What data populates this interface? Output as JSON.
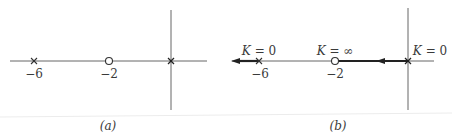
{
  "diagram": {
    "type": "root-locus",
    "colors": {
      "line": "#555555",
      "bold_line": "#222222",
      "text": "#3a3a3a",
      "background": "#ffffff"
    }
  },
  "panels": [
    {
      "id": "a",
      "caption": "(a)",
      "poles": [
        {
          "value": -6,
          "label": "−6",
          "marker": "cross"
        },
        {
          "value": 0,
          "label": "",
          "marker": "cross"
        }
      ],
      "zeros": [
        {
          "value": -2,
          "label": "−2",
          "marker": "circle"
        }
      ]
    },
    {
      "id": "b",
      "caption": "(b)",
      "poles": [
        {
          "value": -6,
          "label": "−6",
          "marker": "cross",
          "gain_label": "K = 0"
        },
        {
          "value": 0,
          "label": "",
          "marker": "cross",
          "gain_label": "K = 0"
        }
      ],
      "zeros": [
        {
          "value": -2,
          "label": "−2",
          "marker": "circle",
          "gain_label": "K = ∞"
        }
      ],
      "locus_segments": [
        {
          "from": 0,
          "to": -2,
          "direction": "left"
        },
        {
          "from": -6,
          "to": "-infinity",
          "direction": "left"
        }
      ]
    }
  ],
  "labels": {
    "a_tick_neg6": "−6",
    "a_tick_neg2": "−2",
    "a_caption": "(a)",
    "b_tick_neg6": "−6",
    "b_tick_neg2": "−2",
    "b_caption": "(b)",
    "b_k_pole6_K": "K",
    "b_k_pole6_rest": " = 0",
    "b_k_zero_K": "K",
    "b_k_zero_rest": " = ∞",
    "b_k_origin_K": "K",
    "b_k_origin_rest": " = 0"
  }
}
